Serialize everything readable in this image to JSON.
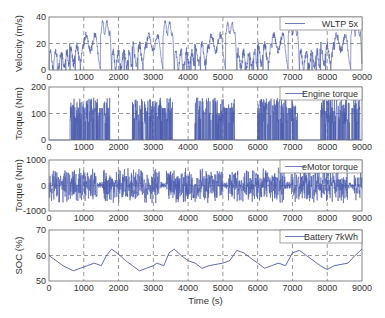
{
  "colors": {
    "line": "#4a5aad",
    "axis": "#666666",
    "grid": "#555555"
  },
  "chart_data": [
    {
      "type": "line",
      "title": "",
      "xlabel": "",
      "ylabel": "Velocity (m/s)",
      "xlim": [
        0,
        9000
      ],
      "ylim": [
        0,
        40
      ],
      "xticks": [
        0,
        1000,
        2000,
        3000,
        4000,
        5000,
        6000,
        7000,
        8000,
        9000
      ],
      "yticks": [
        0,
        20,
        40
      ],
      "legend": [
        "WLTP 5x"
      ],
      "legend_position": "upper right",
      "grid": true,
      "series": [
        {
          "name": "WLTP 5x",
          "note": "WLTP cycle (~1800 s) repeated 5 times; peaks ~36 m/s near t=1650, 3450, 5250, 7050, 8850"
        }
      ]
    },
    {
      "type": "line",
      "xlabel": "",
      "ylabel": "Torque (Nm)",
      "xlim": [
        0,
        9000
      ],
      "ylim": [
        0,
        200
      ],
      "xticks": [
        0,
        1000,
        2000,
        3000,
        4000,
        5000,
        6000,
        7000,
        8000,
        9000
      ],
      "yticks": [
        0,
        100,
        200
      ],
      "legend": [
        "Engine torque"
      ],
      "legend_position": "upper right",
      "grid": true,
      "series": [
        {
          "name": "Engine torque",
          "note": "Intermittent blocks 0-160 Nm; on-periods ~600-1750, 2400-3550, 4200-5350, 6000-7150, 7800-8950"
        }
      ]
    },
    {
      "type": "line",
      "xlabel": "",
      "ylabel": "Torque (Nm)",
      "xlim": [
        0,
        9000
      ],
      "ylim": [
        -1000,
        1000
      ],
      "xticks": [
        0,
        1000,
        2000,
        3000,
        4000,
        5000,
        6000,
        7000,
        8000,
        9000
      ],
      "yticks": [
        -1000,
        0,
        1000
      ],
      "legend": [
        "eMotor torque"
      ],
      "legend_position": "upper right",
      "grid": true,
      "series": [
        {
          "name": "eMotor torque",
          "note": "Oscillating approx -700..+900 Nm"
        }
      ]
    },
    {
      "type": "line",
      "xlabel": "Time (s)",
      "ylabel": "SOC (%)",
      "xlim": [
        0,
        9000
      ],
      "ylim": [
        50,
        70
      ],
      "xticks": [
        0,
        1000,
        2000,
        3000,
        4000,
        5000,
        6000,
        7000,
        8000,
        9000
      ],
      "yticks": [
        50,
        60,
        70
      ],
      "legend": [
        "Battery 7kWh"
      ],
      "legend_position": "upper right",
      "grid": true,
      "series": [
        {
          "name": "Battery 7kWh",
          "x": [
            0,
            200,
            400,
            700,
            900,
            1100,
            1300,
            1500,
            1650,
            1800,
            2000,
            2200,
            2400,
            2600,
            2800,
            3000,
            3100,
            3300,
            3450,
            3600,
            3800,
            4000,
            4200,
            4400,
            4600,
            4800,
            5000,
            5200,
            5400,
            5600,
            5800,
            6000,
            6200,
            6400,
            6600,
            6800,
            7000,
            7200,
            7400,
            7600,
            7800,
            8000,
            8200,
            8400,
            8600,
            8800,
            9000
          ],
          "y": [
            60,
            58,
            56,
            54,
            55,
            56,
            57,
            56,
            60,
            62.5,
            60.5,
            58,
            56,
            54,
            55,
            56,
            57,
            56,
            61,
            62.5,
            60,
            58,
            57,
            55,
            56,
            56.5,
            57,
            58,
            62,
            61,
            59,
            57,
            55,
            56,
            57,
            56,
            61,
            62,
            60,
            58,
            56,
            54.5,
            56,
            56.5,
            57,
            60,
            62.5
          ]
        }
      ]
    }
  ]
}
